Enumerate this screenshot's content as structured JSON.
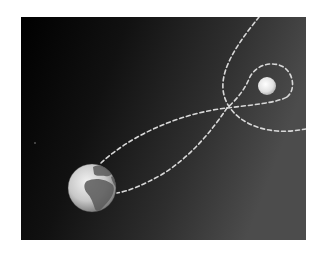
{
  "figure": {
    "background": {
      "color_left": "#020202",
      "color_right": "#4a4a4a"
    },
    "bodies": [
      {
        "name": "Earth",
        "cx": 71,
        "cy": 171,
        "r": 24
      },
      {
        "name": "Moon",
        "cx": 246,
        "cy": 69,
        "r": 9
      }
    ],
    "paths": {
      "color": "#d8d8d8",
      "dash": "4 3",
      "width": 1.6
    },
    "stars": [
      {
        "cx": 14,
        "cy": 126,
        "r": 0.8
      }
    ]
  }
}
